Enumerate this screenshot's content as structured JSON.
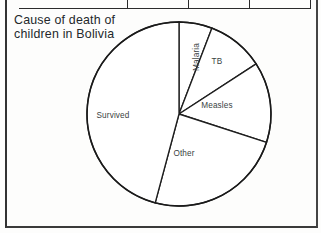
{
  "page": {
    "table_strip": {
      "divider_count": 4,
      "divider_positions": [
        127,
        188,
        249,
        310
      ]
    }
  },
  "chart_title": {
    "line1": "Cause of death of",
    "line2": "children in Bolivia"
  },
  "chart_data": {
    "type": "pie",
    "title": "Cause of death of children in Bolivia",
    "xlabel": "",
    "ylabel": "",
    "legend_position": "none",
    "labels_inside_slices": true,
    "start_angle_deg": 0,
    "direction": "clockwise",
    "categories": [
      "Malaria",
      "TB",
      "Measles",
      "Other",
      "Survived"
    ],
    "values": [
      5.8,
      10.0,
      14.2,
      24.2,
      45.8
    ],
    "value_unit": "percent",
    "slices": [
      {
        "label": "Malaria",
        "percent": 5.8,
        "start_angle_deg": 0,
        "end_angle_deg": 21,
        "label_rotated": true,
        "label_x": 196,
        "label_y": 57
      },
      {
        "label": "TB",
        "percent": 10.0,
        "start_angle_deg": 21,
        "end_angle_deg": 57,
        "label_rotated": false,
        "label_x": 217,
        "label_y": 61
      },
      {
        "label": "Measles",
        "percent": 14.2,
        "start_angle_deg": 57,
        "end_angle_deg": 108,
        "label_rotated": false,
        "label_x": 217,
        "label_y": 105
      },
      {
        "label": "Other",
        "percent": 24.2,
        "start_angle_deg": 108,
        "end_angle_deg": 195,
        "label_rotated": false,
        "label_x": 184,
        "label_y": 153
      },
      {
        "label": "Survived",
        "percent": 45.8,
        "start_angle_deg": 195,
        "end_angle_deg": 360,
        "label_rotated": false,
        "label_x": 113,
        "label_y": 115
      }
    ],
    "geometry": {
      "center_x": 179,
      "center_y": 114,
      "radius": 92
    },
    "colors": {
      "slice_fill": "#ffffff",
      "slice_stroke": "#1f1f1f",
      "text": "#3a3f42",
      "title": "#23282b"
    }
  }
}
